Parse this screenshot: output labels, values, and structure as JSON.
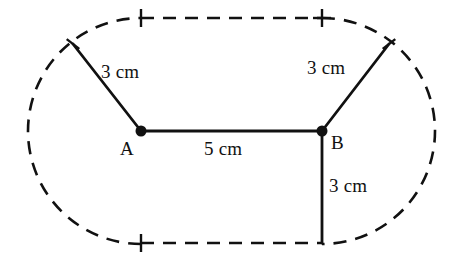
{
  "figure": {
    "background_color": "#ffffff",
    "stroke_color": "#111111",
    "canvas": {
      "width": 453,
      "height": 265
    }
  },
  "points": [
    {
      "id": "A",
      "label": "A",
      "x": 141,
      "y": 131,
      "label_x": 120,
      "label_y": 139,
      "dot_radius": 5.5
    },
    {
      "id": "B",
      "label": "B",
      "x": 322,
      "y": 131,
      "label_x": 331,
      "label_y": 133,
      "dot_radius": 5.5
    }
  ],
  "segments": [
    {
      "id": "segment-A-upper-left",
      "from_x": 141,
      "from_y": 131,
      "to_x": 73,
      "to_y": 44,
      "length_label": "3 cm",
      "label_x": 101,
      "label_y": 62
    },
    {
      "id": "segment-AB",
      "from_x": 141,
      "from_y": 131,
      "to_x": 322,
      "to_y": 131,
      "length_label": "5 cm",
      "label_x": 204,
      "label_y": 139
    },
    {
      "id": "segment-B-upper-right",
      "from_x": 322,
      "from_y": 131,
      "to_x": 389,
      "to_y": 44,
      "length_label": "3 cm",
      "label_x": 307,
      "label_y": 58
    },
    {
      "id": "segment-B-down",
      "from_x": 322,
      "from_y": 131,
      "to_x": 322,
      "to_y": 243,
      "length_label": "3 cm",
      "label_x": 329,
      "label_y": 176
    }
  ],
  "dashed_boundary": {
    "description": "Dashed stadium outline: two straight lines joined by two semicircular arcs",
    "top_line": {
      "from_x": 141,
      "from_y": 18,
      "to_x": 322,
      "to_y": 18
    },
    "bottom_line": {
      "from_x": 141,
      "from_y": 243,
      "to_x": 322,
      "to_y": 243
    },
    "left_arc": {
      "center_x": 141,
      "center_y": 131,
      "radius": 113,
      "start_angle": 90,
      "end_angle": 270
    },
    "right_arc": {
      "center_x": 322,
      "center_y": 131,
      "radius": 113,
      "start_angle": -90,
      "end_angle": 90
    },
    "dash_pattern": "13 9"
  },
  "tick_marks": [
    {
      "id": "tick-top-left",
      "x": 141,
      "y": 18,
      "half_height": 9,
      "half_width": 0,
      "style": "vertical"
    },
    {
      "id": "tick-top-right",
      "x": 322,
      "y": 18,
      "half_height": 9,
      "half_width": 9,
      "style": "cross"
    },
    {
      "id": "tick-bottom-left",
      "x": 141,
      "y": 243,
      "half_height": 9,
      "half_width": 0,
      "style": "vertical"
    },
    {
      "id": "tick-left-arc-upper",
      "x": 73,
      "y": 44,
      "angle": 38,
      "half_height": 8,
      "style": "tilted"
    },
    {
      "id": "tick-right-arc-upper",
      "x": 389,
      "y": 44,
      "angle": -38,
      "half_height": 8,
      "style": "tilted"
    }
  ],
  "measurements": {
    "radius_left_label": "3 cm",
    "chord_AB_label": "5 cm",
    "radius_right_label": "3 cm",
    "vertical_B_label": "3 cm"
  }
}
